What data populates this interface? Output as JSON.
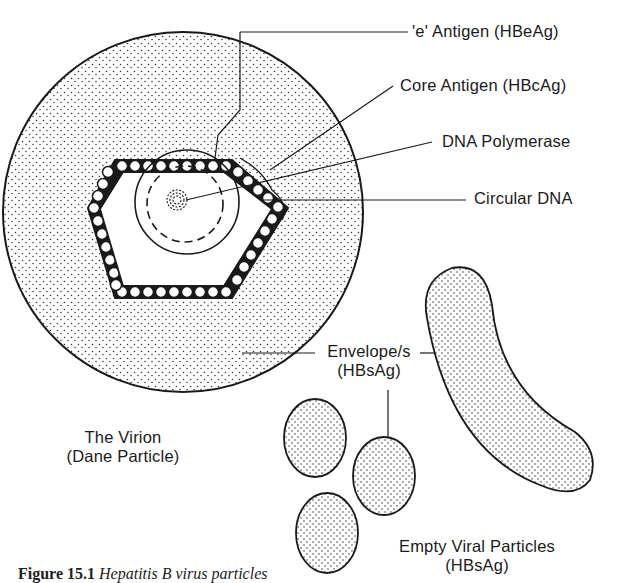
{
  "figure": {
    "caption_number": "Figure 15.1",
    "caption_text": "Hepatitis B virus particles"
  },
  "labels": {
    "e_antigen": "'e' Antigen (HBeAg)",
    "core_antigen": "Core Antigen (HBcAg)",
    "dna_polymerase": "DNA Polymerase",
    "circular_dna": "Circular DNA",
    "envelope_line1": "Envelope/s",
    "envelope_line2": "(HBsAg)",
    "virion_line1": "The Virion",
    "virion_line2": "(Dane Particle)",
    "empty_line1": "Empty Viral Particles",
    "empty_line2": "(HBsAg)"
  },
  "colors": {
    "ink": "#1a1a1a",
    "background": "#ffffff"
  }
}
